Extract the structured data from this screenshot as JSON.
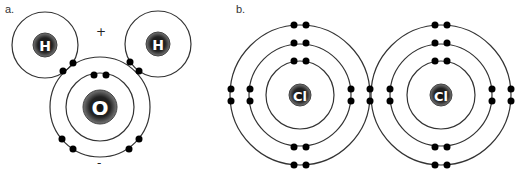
{
  "panels": {
    "a": {
      "label": "a.",
      "molecule": "H2O",
      "atoms": [
        {
          "symbol": "H",
          "cx": 45,
          "cy": 45,
          "shells": [
            33
          ],
          "nucleus_r": 12
        },
        {
          "symbol": "H",
          "cx": 158,
          "cy": 44,
          "shells": [
            33
          ],
          "nucleus_r": 12
        },
        {
          "symbol": "O",
          "cx": 100,
          "cy": 107,
          "shells": [
            34,
            50
          ],
          "nucleus_r": 16
        }
      ],
      "charges": {
        "positive": "+",
        "negative": "-"
      }
    },
    "b": {
      "label": "b.",
      "molecule": "Cl2",
      "atoms": [
        {
          "symbol": "Cl",
          "cx": 300,
          "cy": 95,
          "shells": [
            34,
            50,
            70
          ],
          "nucleus_r": 10
        },
        {
          "symbol": "Cl",
          "cx": 441,
          "cy": 95,
          "shells": [
            34,
            50,
            70
          ],
          "nucleus_r": 10
        }
      ]
    }
  },
  "colors": {
    "line": "#333333",
    "electron": "#000000",
    "nucleus_outer": "#555555",
    "nucleus_inner": "#111111",
    "symbol": "#ffffff"
  }
}
